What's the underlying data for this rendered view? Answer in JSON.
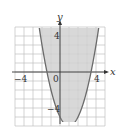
{
  "chart_data": {
    "type": "line",
    "title": "",
    "xlabel": "x",
    "ylabel": "y",
    "xlim": [
      -5,
      5
    ],
    "ylim": [
      -6,
      5
    ],
    "grid": true,
    "x_tick_labels": [
      "-4",
      "0",
      "4"
    ],
    "y_tick_labels": [
      "4",
      "-4"
    ],
    "series": [
      {
        "name": "parabola",
        "equation": "y = x^2 - 2x - 5",
        "vertex": [
          1,
          -6
        ],
        "x_intercepts": [
          -1.45,
          3.45
        ],
        "y_intercept": -5,
        "shaded_region": "above curve (inside parabola)",
        "boundary": "solid"
      }
    ],
    "colors": {
      "shade": "#d4d4d4",
      "curve": "#6b6b6b",
      "grid": "#c8c8c8",
      "axes": "#333333"
    }
  },
  "labels": {
    "x_axis": "x",
    "y_axis": "y",
    "x_neg": "−4",
    "x_origin": "0",
    "x_pos": "4",
    "y_pos": "4",
    "y_neg": "−4"
  }
}
